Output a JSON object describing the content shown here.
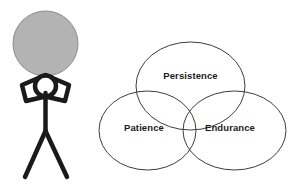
{
  "illustration": {
    "title": "Persistence, Patience and Endurance Venn Diagram with Stick Figure Holding Boulder",
    "background_color": "#ffffff"
  },
  "stick_figure": {
    "name": "stick-figure-holding-boulder",
    "stroke_color": "#1a1a1a",
    "boulder": {
      "name": "boulder",
      "fill_color": "#b3b3b3",
      "stroke_color": "#8c8c8c",
      "cx": 45.5,
      "cy": 43.5,
      "r": 32.5
    },
    "head": {
      "cx": 45.5,
      "cy": 86,
      "r": 10.5
    },
    "arms": {
      "points": "45.5,75 22,85 26,101 45.5,96.5 65,101 69,85 45.5,75"
    },
    "torso": {
      "x1": 45.5,
      "y1": 93,
      "x2": 45.5,
      "y2": 131
    },
    "left_leg": {
      "x1": 45.5,
      "y1": 131,
      "x2": 25,
      "y2": 177
    },
    "right_leg": {
      "x1": 45.5,
      "y1": 131,
      "x2": 67,
      "y2": 177
    }
  },
  "venn": {
    "name": "venn-diagram",
    "stroke_color": "#3d3d3d",
    "fill_color": "none",
    "stroke_width": 1,
    "sets": [
      {
        "id": "persistence",
        "label": "Persistence",
        "cx": 190.5,
        "cy": 86,
        "rx": 54.5,
        "ry": 44,
        "label_x": 190.5,
        "label_y": 76
      },
      {
        "id": "patience",
        "label": "Patience",
        "cx": 147.5,
        "cy": 130.5,
        "rx": 48.5,
        "ry": 39.5,
        "label_x": 144,
        "label_y": 128
      },
      {
        "id": "endurance",
        "label": "Endurance",
        "cx": 234.5,
        "cy": 130.5,
        "rx": 51.5,
        "ry": 39.5,
        "label_x": 230,
        "label_y": 128
      }
    ]
  }
}
